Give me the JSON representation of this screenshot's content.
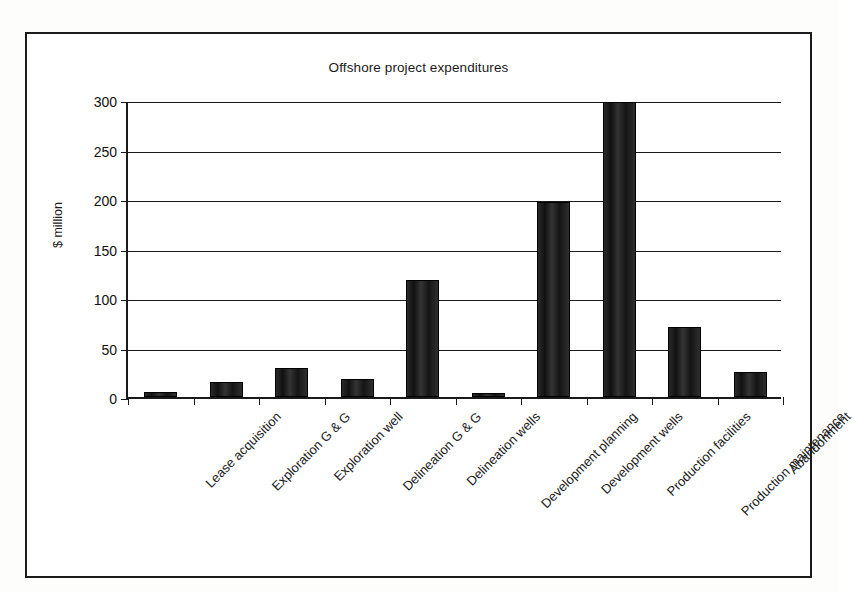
{
  "chart_data": {
    "type": "bar",
    "title": "Offshore project expenditures",
    "xlabel": "",
    "ylabel": "$ million",
    "ylim": [
      0,
      300
    ],
    "yticks": [
      0,
      50,
      100,
      150,
      200,
      250,
      300
    ],
    "ytick_labels": [
      "0",
      "50",
      "100",
      "150",
      "200",
      "250",
      "300"
    ],
    "grid": true,
    "legend": false,
    "categories": [
      "Lease acquisition",
      "Exploration G & G",
      "Exploration well",
      "Delineation G & G",
      "Delineation wells",
      "Development planning",
      "Development wells",
      "Production facilities",
      "Production maintenance",
      "Abandonment"
    ],
    "values": [
      5,
      15,
      29,
      18,
      118,
      4,
      197,
      298,
      71,
      25
    ],
    "bar_color": "#1a1a1a",
    "axis_color": "#1a1a1a",
    "background": "#ffffff"
  }
}
